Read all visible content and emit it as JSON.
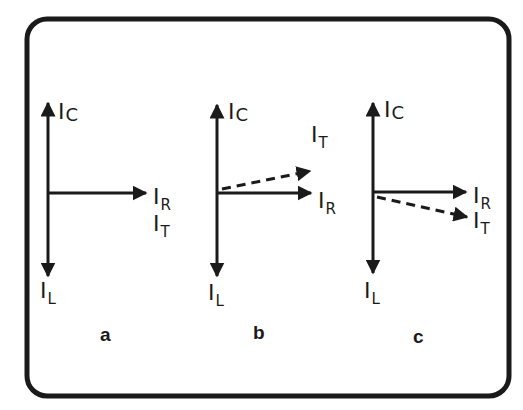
{
  "diagram": {
    "title": "",
    "colors": {
      "stroke": "#1a1a1a",
      "background": "#ffffff"
    },
    "panels": [
      {
        "caption": "a",
        "labels": {
          "ic": {
            "main": "I",
            "sub": "C"
          },
          "il": {
            "main": "I",
            "sub": "L"
          },
          "ir": {
            "main": "I",
            "sub": "R"
          },
          "it": {
            "main": "I",
            "sub": "T"
          }
        },
        "note": "I_T coincides with I_R (in phase)"
      },
      {
        "caption": "b",
        "labels": {
          "ic": {
            "main": "I",
            "sub": "C"
          },
          "il": {
            "main": "I",
            "sub": "L"
          },
          "ir": {
            "main": "I",
            "sub": "R"
          },
          "it": {
            "main": "I",
            "sub": "T"
          }
        },
        "note": "I_T (dashed) leads I_R"
      },
      {
        "caption": "c",
        "labels": {
          "ic": {
            "main": "I",
            "sub": "C"
          },
          "il": {
            "main": "I",
            "sub": "L"
          },
          "ir": {
            "main": "I",
            "sub": "R"
          },
          "it": {
            "main": "I",
            "sub": "T"
          }
        },
        "note": "I_T (dashed) lags I_R"
      }
    ]
  }
}
